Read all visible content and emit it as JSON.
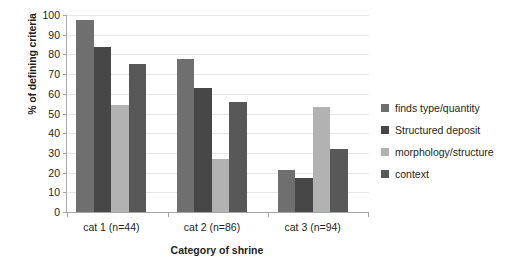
{
  "chart_data": {
    "type": "bar",
    "title": "",
    "xlabel": "Category of shrine",
    "ylabel": "% of defining criteria",
    "categories": [
      "cat 1 (n=44)",
      "cat 2 (n=86)",
      "cat 3 (n=94)"
    ],
    "series": [
      {
        "name": "finds type/quantity",
        "color": "#6f6f6f",
        "values": [
          97.7,
          77.9,
          21.3
        ]
      },
      {
        "name": "Structured deposit",
        "color": "#474747",
        "values": [
          84.0,
          62.8,
          17.2
        ]
      },
      {
        "name": "morphology/structure",
        "color": "#b2b2b2",
        "values": [
          54.5,
          26.7,
          53.2
        ]
      },
      {
        "name": "context",
        "color": "#585858",
        "values": [
          75.0,
          55.8,
          31.8
        ]
      }
    ],
    "ylim": [
      0,
      100
    ],
    "ytick_step": 10,
    "yticks": [
      "100",
      "90",
      "80",
      "70",
      "60",
      "50",
      "40",
      "30",
      "20",
      "10",
      "0"
    ],
    "grid": true,
    "grid_axis": "y",
    "legend_position": "right",
    "axis_color": "#a6a6a6",
    "grid_color": "#e8e8e8",
    "background": "#ffffff"
  }
}
